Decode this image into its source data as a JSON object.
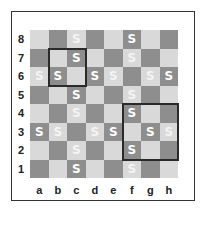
{
  "board": {
    "files": [
      "a",
      "b",
      "c",
      "d",
      "e",
      "f",
      "g",
      "h"
    ],
    "ranks": [
      "8",
      "7",
      "6",
      "5",
      "4",
      "3",
      "2",
      "1"
    ],
    "colors": {
      "light": "#d9d9d9",
      "dark": "#8e8e8e",
      "piece": "#ffffff",
      "highlight": "#2a2a2a"
    },
    "piece_symbol": "S",
    "pieces": [
      "c8",
      "f8",
      "c7",
      "f7",
      "a6",
      "b6",
      "d6",
      "e6",
      "g6",
      "h6",
      "c5",
      "f5",
      "c4",
      "f4",
      "a3",
      "b3",
      "d3",
      "e3",
      "g3",
      "h3",
      "c2",
      "f2",
      "c1",
      "f1"
    ],
    "highlights": [
      {
        "from": "b7",
        "to": "c6"
      },
      {
        "from": "f4",
        "to": "h2"
      }
    ]
  }
}
